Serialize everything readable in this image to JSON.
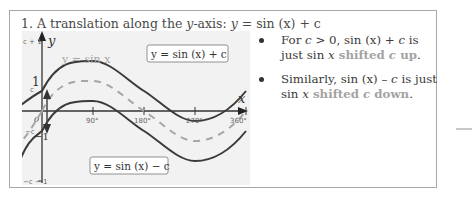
{
  "section": {
    "number": "1.",
    "title_prefix": "A translation along the ",
    "title_axis": "y",
    "title_mid": "-axis: ",
    "title_eq_lhs": "y",
    "title_eq_rest": " = sin (x) + c"
  },
  "graph": {
    "y_axis_label": "y",
    "x_axis_label": "x",
    "y_ticks": [
      "c + 1",
      "1",
      "c",
      "−c",
      "−1",
      "−c − 1"
    ],
    "x_ticks": [
      "0",
      "90°",
      "180°",
      "270°",
      "360°"
    ],
    "curve_labels": {
      "base": "y = sin x",
      "up": "y = sin (x) + c",
      "down": "y = sin (x) − c"
    },
    "colors": {
      "background": "#f2f2f2",
      "curve_shifted": "#3a3a3a",
      "curve_base": "#a6a6a6",
      "axis": "#333333"
    }
  },
  "bullets": [
    {
      "text_before": "For ",
      "var1": "c",
      "text_mid": " > 0, sin (x) + ",
      "var2": "c",
      "text_after": " is just sin ",
      "var3": "x",
      "highlight_1": " shifted ",
      "highlight_var": "c",
      "highlight_2": " up",
      "end": "."
    },
    {
      "text_before": "Similarly, sin (x) – ",
      "var1": "c",
      "text_after": " is just sin ",
      "var2": "x",
      "highlight_1": " shifted ",
      "highlight_var": "c",
      "highlight_2": " down",
      "end": "."
    }
  ],
  "highlight_color": "#a3a3a3"
}
